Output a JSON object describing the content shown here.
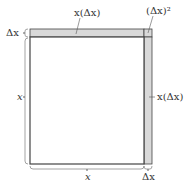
{
  "diagram": {
    "type": "area-of-square-increment",
    "colors": {
      "strip_fill": "#d9d9d9",
      "stroke": "#444444",
      "square_fill": "#ffffff"
    },
    "labels": {
      "top_strip": "x(Δx)",
      "corner": "(Δx)²",
      "right_strip": "x(Δx)",
      "left_dx": "Δx",
      "left_x": "x",
      "bottom_x": "x",
      "bottom_dx": "Δx"
    }
  }
}
